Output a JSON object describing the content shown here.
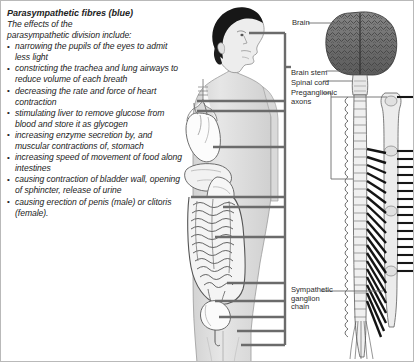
{
  "figure": {
    "title": "Parasympathetic fibres (blue)",
    "intro_lines": [
      "The effects of the",
      "parasympathetic division include:"
    ],
    "effects": [
      "narrowing the pupils of the\neyes to admit less light",
      "constricting the trachea and\nlung airways to reduce\nvolume of each breath",
      "decreasing the rate\nand force of heart\ncontraction",
      "stimulating liver to\nremove glucose from\nblood and store it as\nglycogen",
      "increasing enzyme\nsecretion by, and muscular\ncontractions of, stomach",
      "increasing speed of\nmovement of food along\nintestines",
      "causing contraction of\nbladder wall, opening of\nsphincter, release of\nurine",
      "causing erection of penis\n(male) or clitoris (female)."
    ]
  },
  "callouts": {
    "brain": "Brain",
    "brain_stem": "Brain stem",
    "spinal_cord": "Spinal cord",
    "preganglionic_axons": "Preganglionic\naxons",
    "sympathetic_ganglion_chain": "Sympathetic\nganglion\nchain"
  },
  "colors": {
    "leader_line": "#6b6b6b",
    "body_fill": "#e3e3e3",
    "organ_fill": "#fbfbfb",
    "hair": "#1a1a1a",
    "brain": "#6d6d6d",
    "nerve": "#1c1c1c",
    "text": "#232323",
    "border": "#b9b9b9"
  },
  "icons": {
    "bullet": "bullet-dot-icon",
    "body": "human-body-figure-icon",
    "brain": "brain-icon",
    "spinal_cord": "spinal-cord-icon",
    "ganglion_chain": "ganglion-chain-icon",
    "heart": "heart-icon",
    "lungs": "trachea-lungs-icon",
    "liver": "liver-icon",
    "stomach": "stomach-icon",
    "intestines": "intestines-icon",
    "bladder": "bladder-icon"
  }
}
